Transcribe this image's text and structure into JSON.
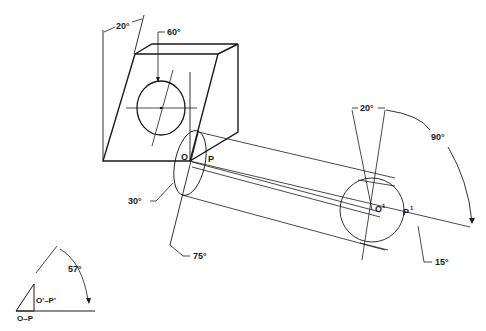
{
  "diagram": {
    "type": "descriptive-geometry-rotation",
    "labels": {
      "angle_top": "20°",
      "angle_hole": "60°",
      "point_o": "O",
      "point_p": "P",
      "angle_30": "30°",
      "angle_75": "75°",
      "angle_20_right": "20°",
      "angle_90": "90°",
      "point_o1": "O",
      "point_o1_sup": "1",
      "point_p1": "P",
      "point_p1_sup": "1",
      "angle_15": "15°",
      "angle_57": "57°",
      "true_length_label": "O'–P'",
      "base_label": "O–P"
    },
    "colors": {
      "ink": "#1a1a1a",
      "background": "#ffffff"
    }
  }
}
